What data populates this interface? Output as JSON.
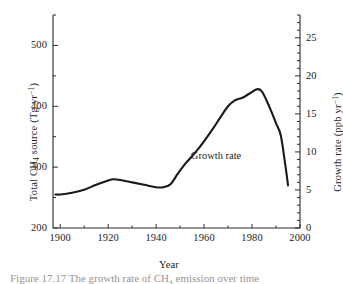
{
  "figure": {
    "caption": "Figure 17.17   The growth rate of CH₄ emission over time",
    "line_color": "#1a1a1a",
    "axis_color": "#2a2a2a",
    "background": "#ffffff"
  },
  "annotations": [
    {
      "text": "Growth rate",
      "x_year": 1965,
      "y_value": 318
    }
  ],
  "chart_data": {
    "type": "line",
    "title": "",
    "xlabel": "Year",
    "ylabel": "Total CH₄ source (Tg yr⁻¹)",
    "y2label": "Growth rate (ppb yr⁻¹)",
    "xlim": [
      1897,
      2000
    ],
    "ylim": [
      200,
      550
    ],
    "y2lim": [
      0,
      28
    ],
    "grid": false,
    "legend": null,
    "xticks": [
      1900,
      1920,
      1940,
      1960,
      1980,
      2000
    ],
    "xticklabels": [
      "1900",
      "1920",
      "1940",
      "1960",
      "1980",
      "2000"
    ],
    "xminor_step": 10,
    "yticks": [
      200,
      300,
      400,
      500
    ],
    "yticklabels": [
      "200",
      "300",
      "400",
      "500"
    ],
    "yminor_step": 50,
    "y2ticks": [
      0,
      5,
      10,
      15,
      20,
      25
    ],
    "y2ticklabels": [
      "0",
      "5",
      "10",
      "15",
      "20",
      "25"
    ],
    "y2minor_step": 1,
    "series": [
      {
        "name": "Growth rate",
        "x": [
          1898,
          1900,
          1905,
          1910,
          1915,
          1920,
          1922,
          1925,
          1930,
          1935,
          1940,
          1943,
          1946,
          1949,
          1952,
          1955,
          1958,
          1961,
          1964,
          1967,
          1970,
          1973,
          1976,
          1979,
          1982,
          1984,
          1986,
          1988,
          1990,
          1992,
          1994,
          1995
        ],
        "y": [
          255,
          255,
          258,
          263,
          271,
          278,
          280,
          279,
          275,
          271,
          267,
          267,
          272,
          289,
          305,
          318,
          332,
          348,
          365,
          383,
          400,
          410,
          414,
          421,
          428,
          425,
          410,
          392,
          372,
          352,
          300,
          270
        ],
        "y_units": "Tg yr^-1",
        "y2_equivalent": [
          4.4,
          4.4,
          4.6,
          5.0,
          5.7,
          6.2,
          6.4,
          6.3,
          6.0,
          5.7,
          5.4,
          5.4,
          5.8,
          7.1,
          8.4,
          9.4,
          10.6,
          11.8,
          13.2,
          14.6,
          16.0,
          16.8,
          17.1,
          17.7,
          18.2,
          18.0,
          16.8,
          15.4,
          13.8,
          12.2,
          8.0,
          5.6
        ]
      }
    ]
  }
}
